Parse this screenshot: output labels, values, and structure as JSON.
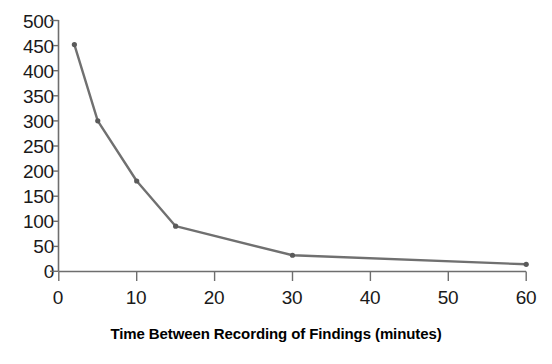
{
  "chart_data": {
    "type": "line",
    "title": "",
    "subtitle": "",
    "xlabel": "Time Between Recording of Findings (minutes)",
    "ylabel": "",
    "xlim": [
      0,
      60
    ],
    "ylim": [
      0,
      500
    ],
    "xticks": [
      0,
      10,
      20,
      30,
      40,
      50,
      60
    ],
    "yticks": [
      0,
      50,
      100,
      150,
      200,
      250,
      300,
      350,
      400,
      450,
      500
    ],
    "xtick_labels": [
      "0",
      "10",
      "20",
      "30",
      "40",
      "50",
      "60"
    ],
    "ytick_labels": [
      "0",
      "50",
      "100",
      "150",
      "200",
      "250",
      "300",
      "350",
      "400",
      "450",
      "500"
    ],
    "grid": false,
    "legend": null,
    "series": [
      {
        "name": "Findings",
        "color": "#707070",
        "marker": "circle",
        "x": [
          2,
          5,
          10,
          15,
          30,
          60
        ],
        "y": [
          452,
          300,
          180,
          90,
          32,
          14
        ],
        "points": [
          {
            "x": 2,
            "y": 452
          },
          {
            "x": 5,
            "y": 300
          },
          {
            "x": 10,
            "y": 180
          },
          {
            "x": 15,
            "y": 90
          },
          {
            "x": 30,
            "y": 32
          },
          {
            "x": 60,
            "y": 14
          }
        ]
      }
    ],
    "colors": {
      "line": "#707070",
      "marker": "#5a5a5a",
      "axis": "#6e6e6e",
      "text": "#1a1a1a",
      "background": "#ffffff"
    }
  }
}
